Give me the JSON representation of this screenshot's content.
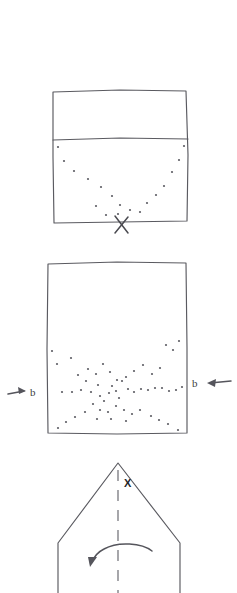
{
  "figure": {
    "title": "",
    "background_color": "#ffffff",
    "ink_color": "#5a5a60",
    "dot_color": "#5d5d64",
    "width": 237,
    "height": 593,
    "panels": [
      {
        "id": "panel-top",
        "name": "vessel-with-v-shaped-dot-trajectory",
        "shape": "rectangle",
        "box": {
          "x": 52,
          "y": 90,
          "width": 136,
          "height": 132
        },
        "divider_line_y": 139,
        "markers": [
          {
            "type": "x-mark",
            "label": "X",
            "x": 122,
            "y": 225
          }
        ],
        "dots": [
          [
            58,
            147
          ],
          [
            63,
            160
          ],
          [
            73,
            170
          ],
          [
            102,
            186
          ],
          [
            113,
            192
          ],
          [
            88,
            178
          ],
          [
            131,
            203
          ],
          [
            137,
            209
          ],
          [
            112,
            196
          ],
          [
            125,
            209
          ],
          [
            155,
            195
          ],
          [
            164,
            186
          ],
          [
            172,
            172
          ],
          [
            179,
            160
          ],
          [
            184,
            146
          ],
          [
            147,
            203
          ],
          [
            140,
            212
          ],
          [
            106,
            215
          ],
          [
            118,
            214
          ]
        ]
      },
      {
        "id": "panel-middle",
        "name": "vessel-with-scattered-dots-and-b-arrows",
        "shape": "rectangle",
        "box": {
          "x": 47,
          "y": 262,
          "width": 140,
          "height": 172
        },
        "band_line_y": 390,
        "annotations": [
          {
            "name": "label-b-left",
            "text": "b",
            "x": 32,
            "y": 394,
            "arrow": "right"
          },
          {
            "name": "label-b-right",
            "text": "b",
            "x": 195,
            "y": 384,
            "arrow": "left"
          }
        ],
        "dots": [
          [
            52,
            351
          ],
          [
            56,
            364
          ],
          [
            71,
            358
          ],
          [
            78,
            375
          ],
          [
            85,
            381
          ],
          [
            62,
            392
          ],
          [
            72,
            392
          ],
          [
            81,
            390
          ],
          [
            91,
            392
          ],
          [
            98,
            385
          ],
          [
            100,
            396
          ],
          [
            104,
            401
          ],
          [
            109,
            393
          ],
          [
            112,
            386
          ],
          [
            116,
            391
          ],
          [
            119,
            398
          ],
          [
            96,
            374
          ],
          [
            88,
            369
          ],
          [
            103,
            364
          ],
          [
            110,
            372
          ],
          [
            122,
            381
          ],
          [
            128,
            389
          ],
          [
            133,
            392
          ],
          [
            140,
            389
          ],
          [
            147,
            390
          ],
          [
            154,
            388
          ],
          [
            161,
            388
          ],
          [
            168,
            391
          ],
          [
            175,
            390
          ],
          [
            180,
            387
          ],
          [
            152,
            374
          ],
          [
            159,
            368
          ],
          [
            166,
            360
          ],
          [
            172,
            350
          ],
          [
            178,
            344
          ],
          [
            166,
            345
          ],
          [
            143,
            365
          ],
          [
            134,
            371
          ],
          [
            126,
            377
          ],
          [
            117,
            380
          ],
          [
            93,
            404
          ],
          [
            100,
            410
          ],
          [
            108,
            412
          ],
          [
            116,
            406
          ],
          [
            124,
            410
          ],
          [
            132,
            414
          ],
          [
            140,
            410
          ],
          [
            85,
            412
          ],
          [
            75,
            417
          ],
          [
            66,
            422
          ],
          [
            58,
            428
          ],
          [
            151,
            416
          ],
          [
            159,
            420
          ],
          [
            168,
            424
          ],
          [
            176,
            430
          ],
          [
            126,
            421
          ],
          [
            111,
            419
          ],
          [
            97,
            419
          ]
        ]
      },
      {
        "id": "panel-bottom",
        "name": "house-shape-with-rotation-axis",
        "shape": "pentagon-house",
        "apex": {
          "x": 118,
          "y": 463
        },
        "left_shoulder": {
          "x": 58,
          "y": 543
        },
        "right_shoulder": {
          "x": 180,
          "y": 543
        },
        "left_foot": {
          "x": 58,
          "y": 593
        },
        "right_foot": {
          "x": 180,
          "y": 593
        },
        "axis_line": {
          "x": 118,
          "y1": 470,
          "y2": 593,
          "style": "dashed"
        },
        "markers": [
          {
            "type": "text",
            "name": "apex-label-x",
            "label": "X",
            "x": 128,
            "y": 483
          }
        ],
        "rotation_arrow": {
          "name": "counterclockwise-rotation-arrow",
          "direction": "counterclockwise",
          "start": {
            "x": 152,
            "y": 549
          },
          "end": {
            "x": 92,
            "y": 563
          }
        }
      }
    ],
    "labels": {
      "b_label": "b",
      "x_label": "X"
    }
  }
}
